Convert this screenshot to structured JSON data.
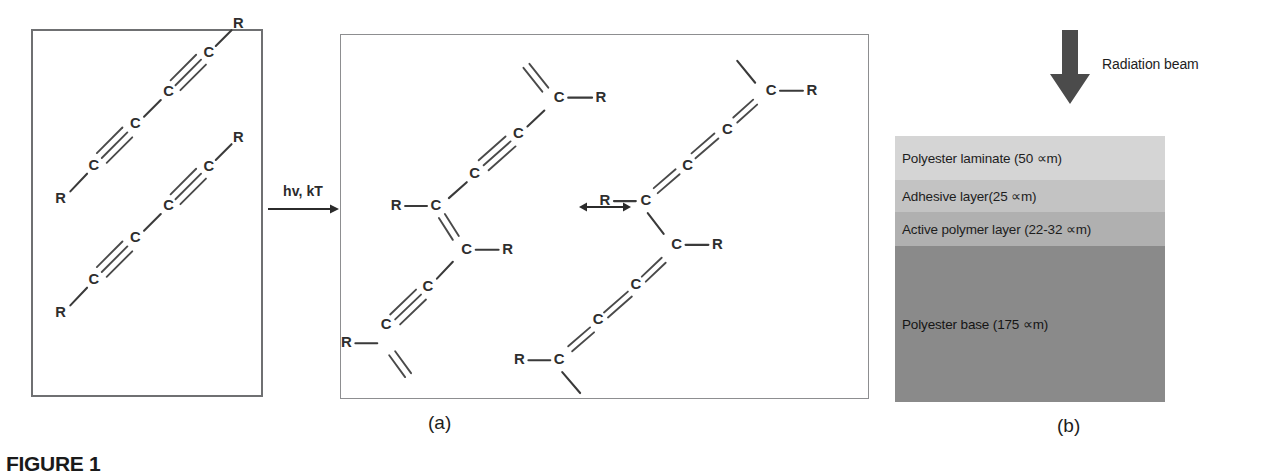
{
  "figure": {
    "caption_label": "FIGURE 1",
    "caption_rest": "",
    "sub_caption_a": "(a)",
    "sub_caption_b": "(b)"
  },
  "reaction": {
    "condition_label": "hv, kT",
    "arrow_icon": "right-arrow-icon",
    "resonance_icon": "double-headed-arrow-icon"
  },
  "monomer_panel": {
    "name": "diacetylene monomer stack",
    "atom_R": "R",
    "atom_C": "C",
    "chains": [
      {
        "id": "chain-top",
        "labels": [
          "R",
          "C",
          "C",
          "C",
          "C",
          "R"
        ]
      },
      {
        "id": "chain-bottom",
        "labels": [
          "R",
          "C",
          "C",
          "C",
          "C",
          "R"
        ]
      }
    ]
  },
  "polymer_panel": {
    "name": "polydiacetylene resonance forms",
    "forms": [
      {
        "id": "acetylenic-form",
        "labels": [
          "R",
          "C",
          "C",
          "C",
          "C",
          "R"
        ]
      },
      {
        "id": "butatrienic-form",
        "labels": [
          "R",
          "C",
          "C",
          "C",
          "C",
          "R"
        ]
      }
    ]
  },
  "layer_stack": {
    "beam_label": "Radiation beam",
    "beam_icon": "down-arrow-icon",
    "layers": [
      {
        "id": "polyester-laminate",
        "label": "Polyester laminate (50 ∝m)",
        "color": "#d5d5d5"
      },
      {
        "id": "adhesive-layer",
        "label": "Adhesive layer(25 ∝m)",
        "color": "#c3c3c3"
      },
      {
        "id": "active-polymer",
        "label": "Active polymer layer (22-32 ∝m)",
        "color": "#b0b0b0"
      },
      {
        "id": "polyester-base",
        "label": "Polyester base (175 ∝m)",
        "color": "#8a8a8a"
      }
    ]
  }
}
